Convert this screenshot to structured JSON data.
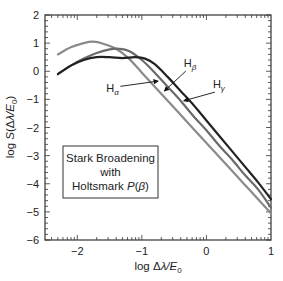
{
  "chart_data": {
    "type": "line",
    "title": "",
    "xlabel": "log Δλ/E0",
    "ylabel": "log S(Δλ/E0)",
    "xlim": [
      -2.5,
      1
    ],
    "ylim": [
      -6,
      2
    ],
    "xticks": [
      -2,
      -1,
      0,
      1
    ],
    "yticks": [
      -6,
      -5,
      -4,
      -3,
      -2,
      -1,
      0,
      1,
      2
    ],
    "grid": false,
    "legend_box": {
      "lines": [
        "Stark Broadening",
        "with",
        "Holtsmark P(β)"
      ],
      "position": "lower-left"
    },
    "series": [
      {
        "name": "Hα",
        "color": "#8a8a8a",
        "x": [
          -2.3,
          -2.1,
          -1.9,
          -1.75,
          -1.6,
          -1.4,
          -1.2,
          -1.0,
          -0.8,
          -0.6,
          -0.4,
          -0.2,
          0.0,
          0.2,
          0.4,
          0.6,
          0.8,
          1.0
        ],
        "y": [
          0.6,
          0.85,
          1.0,
          1.05,
          0.98,
          0.8,
          0.45,
          -0.05,
          -0.55,
          -1.05,
          -1.55,
          -2.05,
          -2.55,
          -3.05,
          -3.55,
          -4.05,
          -4.55,
          -5.05
        ]
      },
      {
        "name": "Hβ",
        "color": "#6a6a6a",
        "x": [
          -2.3,
          -2.1,
          -1.9,
          -1.7,
          -1.5,
          -1.35,
          -1.2,
          -1.0,
          -0.8,
          -0.6,
          -0.4,
          -0.2,
          0.0,
          0.2,
          0.4,
          0.6,
          0.8,
          1.0
        ],
        "y": [
          -0.1,
          0.2,
          0.45,
          0.65,
          0.78,
          0.8,
          0.72,
          0.4,
          -0.05,
          -0.55,
          -1.05,
          -1.6,
          -2.1,
          -2.65,
          -3.15,
          -3.7,
          -4.2,
          -4.85
        ]
      },
      {
        "name": "Hγ",
        "color": "#222222",
        "x": [
          -2.3,
          -2.1,
          -1.9,
          -1.7,
          -1.5,
          -1.3,
          -1.1,
          -0.95,
          -0.8,
          -0.6,
          -0.4,
          -0.2,
          0.0,
          0.2,
          0.4,
          0.6,
          0.8,
          1.0
        ],
        "y": [
          -0.1,
          0.2,
          0.4,
          0.5,
          0.5,
          0.47,
          0.5,
          0.45,
          0.25,
          -0.2,
          -0.7,
          -1.2,
          -1.75,
          -2.3,
          -2.85,
          -3.4,
          -3.95,
          -4.55
        ]
      }
    ],
    "annotations": [
      {
        "label": "H",
        "sub": "α",
        "arrow_to": [
          -0.75,
          -0.35
        ],
        "text_at": [
          -1.55,
          -0.75
        ]
      },
      {
        "label": "H",
        "sub": "β",
        "arrow_to": [
          -0.65,
          -0.7
        ],
        "text_at": [
          -0.35,
          0.15
        ]
      },
      {
        "label": "H",
        "sub": "γ",
        "arrow_to": [
          -0.35,
          -1.05
        ],
        "text_at": [
          0.1,
          -0.6
        ]
      }
    ]
  }
}
